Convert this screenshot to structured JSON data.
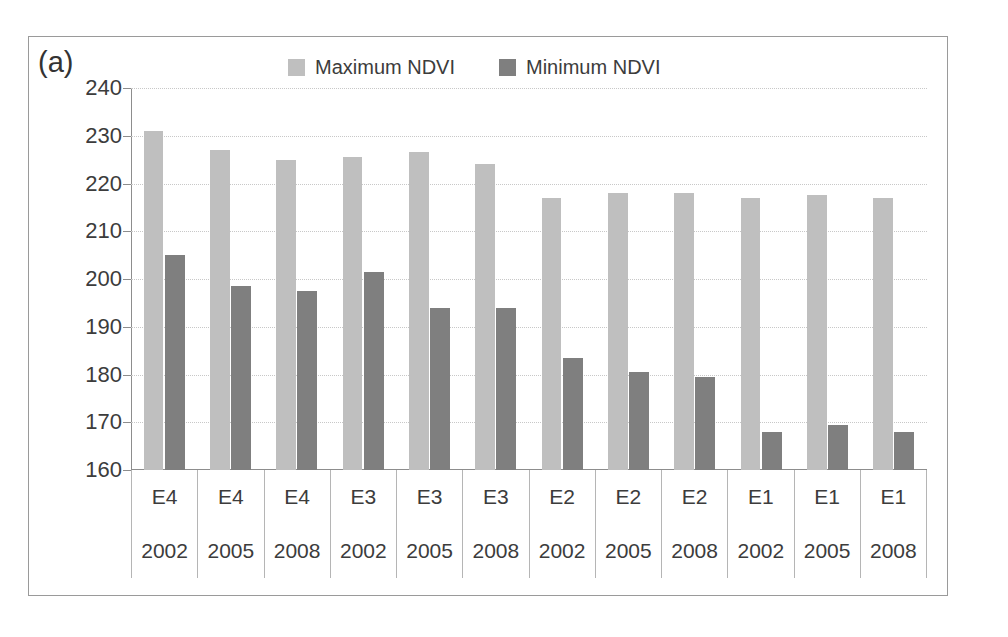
{
  "panel": {
    "label": "(a)"
  },
  "legend": {
    "position": "top-center",
    "entries": [
      {
        "label": "Maximum NDVI",
        "color": "#bfbfbf",
        "swatch_name": "legend-swatch-maximum"
      },
      {
        "label": "Minimum NDVI",
        "color": "#7f7f7f",
        "swatch_name": "legend-swatch-minimum"
      }
    ]
  },
  "chart_data": {
    "type": "bar",
    "title": "(a)",
    "xlabel": "",
    "ylabel": "",
    "ylim": [
      160,
      240
    ],
    "ytick_step": 10,
    "yticks": [
      240,
      230,
      220,
      210,
      200,
      190,
      180,
      170,
      160
    ],
    "grid": true,
    "legend": [
      "Maximum NDVI",
      "Minimum NDVI"
    ],
    "legend_position": "top-center",
    "categories": [
      "E4 2002",
      "E4 2005",
      "E4 2008",
      "E3 2002",
      "E3 2005",
      "E3 2008",
      "E2 2002",
      "E2 2005",
      "E2 2008",
      "E1 2002",
      "E1 2005",
      "E1 2008"
    ],
    "sites": [
      "E4",
      "E4",
      "E4",
      "E3",
      "E3",
      "E3",
      "E2",
      "E2",
      "E2",
      "E1",
      "E1",
      "E1"
    ],
    "years": [
      "2002",
      "2005",
      "2008",
      "2002",
      "2005",
      "2008",
      "2002",
      "2005",
      "2008",
      "2002",
      "2005",
      "2008"
    ],
    "series": [
      {
        "name": "Maximum NDVI",
        "color": "#bfbfbf",
        "values": [
          231,
          227,
          225,
          225.5,
          226.5,
          224,
          217,
          218,
          218,
          217,
          217.5,
          217
        ]
      },
      {
        "name": "Minimum NDVI",
        "color": "#7f7f7f",
        "values": [
          205,
          198.5,
          197.5,
          201.5,
          194,
          194,
          183.5,
          180.5,
          179.5,
          168,
          169.5,
          168
        ]
      }
    ]
  },
  "colors": {
    "maximum_bar": "#bfbfbf",
    "minimum_bar": "#7f7f7f",
    "gridline": "#c8c8c8",
    "axis": "#8d8d8d",
    "frame": "#9a9a9a",
    "text": "#3c3c3c",
    "background": "#ffffff"
  }
}
